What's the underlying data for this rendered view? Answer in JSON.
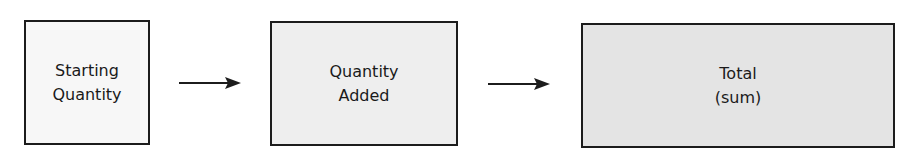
{
  "diagram": {
    "boxes": [
      {
        "line1": "Starting",
        "line2": "Quantity",
        "fill": "#f7f7f7"
      },
      {
        "line1": "Quantity",
        "line2": "Added",
        "fill": "#eeeeee"
      },
      {
        "line1": "Total",
        "line2": "(sum)",
        "fill": "#e4e4e4"
      }
    ],
    "arrows": [
      {
        "from": "Starting Quantity",
        "to": "Quantity Added"
      },
      {
        "from": "Quantity Added",
        "to": "Total (sum)"
      }
    ],
    "colors": {
      "stroke": "#1c1c1c",
      "text": "#1a1a1a"
    }
  }
}
